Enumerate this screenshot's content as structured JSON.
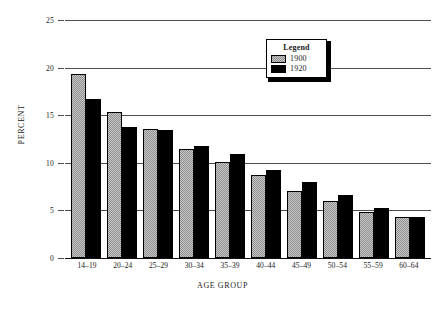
{
  "chart_data": {
    "type": "bar",
    "title": "",
    "xlabel": "AGE GROUP",
    "ylabel": "PERCENT",
    "categories": [
      "14–19",
      "20–24",
      "25–29",
      "30–34",
      "35–39",
      "40–44",
      "45–49",
      "50–54",
      "55–59",
      "60–64"
    ],
    "series": [
      {
        "name": "1900",
        "values": [
          19.3,
          15.3,
          13.6,
          11.5,
          10.1,
          8.7,
          7.0,
          6.0,
          4.8,
          4.3
        ],
        "color": "#8c8c8c"
      },
      {
        "name": "1920",
        "values": [
          16.7,
          13.8,
          13.4,
          11.8,
          10.9,
          9.2,
          8.0,
          6.6,
          5.3,
          4.3
        ],
        "color": "#000000"
      }
    ],
    "ylim": [
      0,
      25
    ],
    "yticks": [
      0,
      5,
      10,
      15,
      20,
      25
    ],
    "ytick_labels": [
      "0",
      "5",
      "10",
      "15",
      "20",
      "25"
    ],
    "grid": true,
    "legend_position": "upper-right",
    "legend_title": "Legend"
  },
  "legend": {
    "title": "Legend",
    "entries": [
      {
        "label": "1900",
        "swatch": "gray-hatch-swatch"
      },
      {
        "label": "1920",
        "swatch": "black-swatch"
      }
    ]
  }
}
